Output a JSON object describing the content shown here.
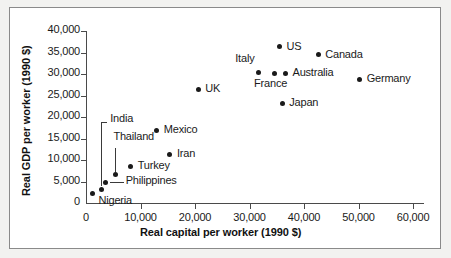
{
  "chart_data": {
    "type": "scatter",
    "title": "",
    "xlabel": "Real capital per worker (1990 $)",
    "ylabel": "Real GDP per worker (1990 $)",
    "xlim": [
      0,
      62000
    ],
    "ylim": [
      0,
      41500
    ],
    "grid": false,
    "legend": "none",
    "xticks": [
      "0",
      "10,000",
      "20,000",
      "30,000",
      "40,000",
      "50,000",
      "60,000"
    ],
    "xtick_values": [
      0,
      10000,
      20000,
      30000,
      40000,
      50000,
      60000
    ],
    "yticks": [
      "0",
      "5,000",
      "10,000",
      "15,000",
      "20,000",
      "25,000",
      "30,000",
      "35,000",
      "40,000"
    ],
    "ytick_values": [
      0,
      5000,
      10000,
      15000,
      20000,
      25000,
      30000,
      35000,
      40000
    ],
    "points": [
      {
        "name": "Nigeria",
        "x": 1200,
        "y": 2100,
        "label_dx": 6,
        "label_dy": 7,
        "leader": false
      },
      {
        "name": "India",
        "x": 2800,
        "y": 3200,
        "label_dx": 9,
        "label_dy": -70,
        "leader": true,
        "leader_type": "elbow"
      },
      {
        "name": "Philippines",
        "x": 3600,
        "y": 4800,
        "label_dx": 20,
        "label_dy": -1,
        "leader": true,
        "leader_type": "horizontal"
      },
      {
        "name": "Thailand",
        "x": 5400,
        "y": 6600,
        "label_dx": -2,
        "label_dy": -38,
        "leader": true,
        "leader_type": "vertical"
      },
      {
        "name": "Turkey",
        "x": 8200,
        "y": 8600,
        "label_dx": 7,
        "label_dy": 0,
        "leader": false
      },
      {
        "name": "Iran",
        "x": 15400,
        "y": 11400,
        "label_dx": 7,
        "label_dy": 0,
        "leader": false
      },
      {
        "name": "Mexico",
        "x": 13000,
        "y": 17000,
        "label_dx": 7,
        "label_dy": 0,
        "leader": false
      },
      {
        "name": "UK",
        "x": 20600,
        "y": 26500,
        "label_dx": 7,
        "label_dy": 0,
        "leader": false
      },
      {
        "name": "Italy",
        "x": 31600,
        "y": 30400,
        "label_dx": -5,
        "label_dy": -14,
        "leader": false
      },
      {
        "name": "France",
        "x": 34500,
        "y": 30200,
        "label_dx": -6,
        "label_dy": 11,
        "leader": false
      },
      {
        "name": "Australia",
        "x": 36600,
        "y": 30300,
        "label_dx": 7,
        "label_dy": 0,
        "leader": false
      },
      {
        "name": "US",
        "x": 35500,
        "y": 36400,
        "label_dx": 7,
        "label_dy": 0,
        "leader": false
      },
      {
        "name": "Canada",
        "x": 42600,
        "y": 34600,
        "label_dx": 7,
        "label_dy": 0,
        "leader": false
      },
      {
        "name": "Japan",
        "x": 36000,
        "y": 23200,
        "label_dx": 7,
        "label_dy": 0,
        "leader": false
      },
      {
        "name": "Germany",
        "x": 50200,
        "y": 28800,
        "label_dx": 7,
        "label_dy": 0,
        "leader": false
      }
    ]
  },
  "colors": {
    "marker": "#1a1a1a",
    "axis": "#4a4a4a",
    "text": "#1a1a1a",
    "background": "#f2f2f0",
    "panel": "#ffffff",
    "frame": "#8a8a8a"
  }
}
